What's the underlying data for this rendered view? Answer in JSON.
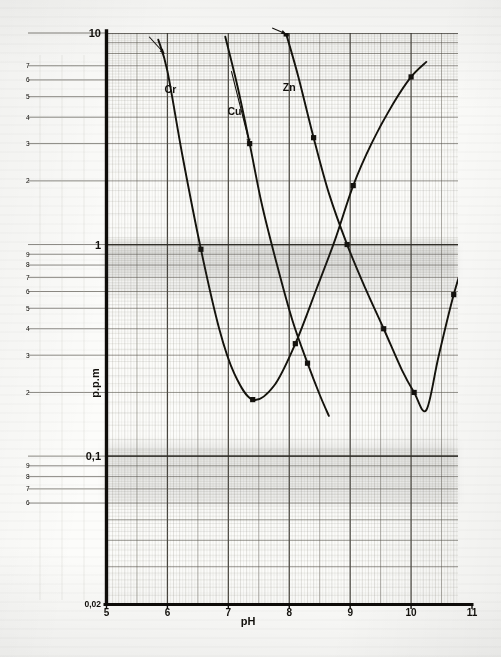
{
  "figure": {
    "kind": "scanned-graph-paper-plot",
    "paper_color": "#fbfbf9",
    "ink_color": "#15130f",
    "grid_color": "#6e6a60"
  },
  "axes": {
    "x_axis_label": "pH",
    "y_axis_label": "p.p.m",
    "x_ticks": [
      "5",
      "6",
      "7",
      "8",
      "9",
      "10",
      "11"
    ],
    "y_major_ticks": [
      "10",
      "1",
      "0,1",
      "0,02"
    ],
    "y_minor_ticks_decade1": [
      "7",
      "6",
      "5",
      "4",
      "3",
      "2"
    ],
    "y_minor_ticks_decade2": [
      "9",
      "8",
      "7",
      "6",
      "5",
      "4",
      "3",
      "2"
    ],
    "y_minor_ticks_decade3": [
      "9",
      "8",
      "7",
      "6"
    ],
    "origin_label": "0,02"
  },
  "chart_data": {
    "type": "line",
    "title": "",
    "subtitle": "",
    "xlabel": "pH",
    "ylabel": "p.p.m",
    "xlim": [
      5,
      11
    ],
    "ylim": [
      0.02,
      10
    ],
    "yscale": "log",
    "xscale": "linear",
    "grid": true,
    "legend": "inline-labels",
    "annotations": [
      {
        "text": "Cr",
        "x": 6.05,
        "y": 5.2
      },
      {
        "text": "Cu",
        "x": 7.1,
        "y": 4.1
      },
      {
        "text": "Zn",
        "x": 8.0,
        "y": 5.3
      }
    ],
    "series": [
      {
        "name": "Cr",
        "label": "Cr",
        "color": "#15130f",
        "points": [
          {
            "x": 5.85,
            "y": 9.3
          },
          {
            "x": 6.0,
            "y": 6.6
          },
          {
            "x": 6.25,
            "y": 2.6
          },
          {
            "x": 6.55,
            "y": 0.95
          },
          {
            "x": 6.85,
            "y": 0.4
          },
          {
            "x": 7.1,
            "y": 0.245
          },
          {
            "x": 7.4,
            "y": 0.185
          },
          {
            "x": 7.75,
            "y": 0.215
          },
          {
            "x": 8.1,
            "y": 0.34
          },
          {
            "x": 8.45,
            "y": 0.62
          },
          {
            "x": 8.75,
            "y": 1.05
          },
          {
            "x": 9.05,
            "y": 1.9
          },
          {
            "x": 9.35,
            "y": 3.0
          },
          {
            "x": 9.7,
            "y": 4.6
          },
          {
            "x": 10.0,
            "y": 6.2
          },
          {
            "x": 10.25,
            "y": 7.3
          }
        ],
        "markers_at": [
          {
            "x": 6.55,
            "y": 0.95
          },
          {
            "x": 7.4,
            "y": 0.185
          },
          {
            "x": 8.1,
            "y": 0.34
          },
          {
            "x": 9.05,
            "y": 1.9
          },
          {
            "x": 10.0,
            "y": 6.2
          }
        ],
        "minimum": {
          "x": 7.45,
          "y": 0.18
        }
      },
      {
        "name": "Cu",
        "label": "Cu",
        "color": "#15130f",
        "points": [
          {
            "x": 6.95,
            "y": 9.6
          },
          {
            "x": 7.15,
            "y": 5.6
          },
          {
            "x": 7.35,
            "y": 3.0
          },
          {
            "x": 7.55,
            "y": 1.55
          },
          {
            "x": 7.8,
            "y": 0.8
          },
          {
            "x": 8.05,
            "y": 0.44
          },
          {
            "x": 8.3,
            "y": 0.275
          },
          {
            "x": 8.5,
            "y": 0.195
          },
          {
            "x": 8.65,
            "y": 0.155
          }
        ],
        "markers_at": [
          {
            "x": 7.35,
            "y": 3.0
          },
          {
            "x": 8.3,
            "y": 0.275
          }
        ],
        "minimum": null
      },
      {
        "name": "Zn",
        "label": "Zn",
        "color": "#15130f",
        "points": [
          {
            "x": 7.95,
            "y": 9.9
          },
          {
            "x": 8.15,
            "y": 6.2
          },
          {
            "x": 8.4,
            "y": 3.2
          },
          {
            "x": 8.65,
            "y": 1.75
          },
          {
            "x": 8.95,
            "y": 1.0
          },
          {
            "x": 9.25,
            "y": 0.62
          },
          {
            "x": 9.55,
            "y": 0.4
          },
          {
            "x": 9.85,
            "y": 0.255
          },
          {
            "x": 10.05,
            "y": 0.2
          },
          {
            "x": 10.25,
            "y": 0.165
          },
          {
            "x": 10.45,
            "y": 0.295
          },
          {
            "x": 10.7,
            "y": 0.58
          },
          {
            "x": 10.95,
            "y": 1.0
          }
        ],
        "markers_at": [
          {
            "x": 7.95,
            "y": 9.9
          },
          {
            "x": 8.4,
            "y": 3.2
          },
          {
            "x": 8.95,
            "y": 1.0
          },
          {
            "x": 9.55,
            "y": 0.4
          },
          {
            "x": 10.05,
            "y": 0.2
          },
          {
            "x": 10.7,
            "y": 0.58
          },
          {
            "x": 10.95,
            "y": 1.0
          }
        ],
        "minimum": {
          "x": 10.25,
          "y": 0.165
        }
      }
    ]
  }
}
